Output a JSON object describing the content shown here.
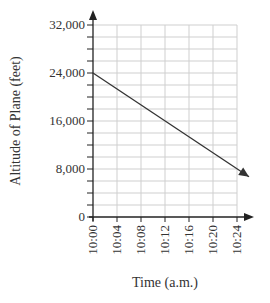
{
  "chart_data": {
    "type": "line",
    "title": "",
    "xlabel": "Time (a.m.)",
    "ylabel": "Altitude of Plane (feet)",
    "x_tick_labels": [
      "10:00",
      "10:04",
      "10:08",
      "10:12",
      "10:16",
      "10:20",
      "10:24"
    ],
    "y_tick_labels": [
      "0",
      "8,000",
      "16,000",
      "24,000",
      "32,000"
    ],
    "x_minutes_range": [
      0,
      24
    ],
    "ylim": [
      0,
      32000
    ],
    "y_minor_step": 2000,
    "x_grid_step_minutes": 4,
    "grid": true,
    "series": [
      {
        "name": "Altitude",
        "x": [
          "10:00",
          "10:26"
        ],
        "x_minutes": [
          0,
          26
        ],
        "values": [
          24000,
          6700
        ],
        "end_arrow": true
      }
    ],
    "axes_arrows": true,
    "line_color": "#333333",
    "grid_color": "#cfcfcf"
  }
}
